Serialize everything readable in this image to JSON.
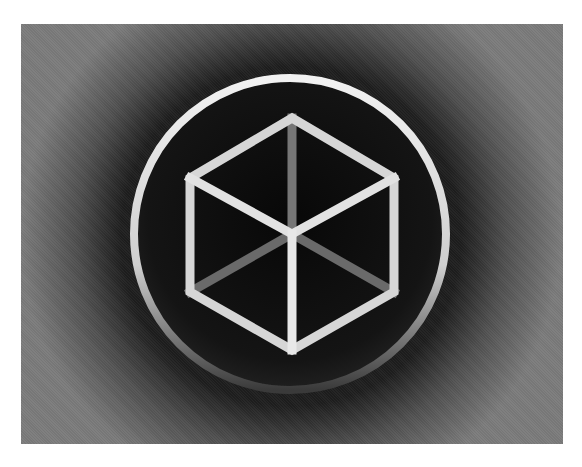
{
  "image": {
    "description": "Gray textured panel with a white ring enclosing a wireframe cube (hexagon with Y spokes) on a black disc",
    "colors": {
      "page_background": "#ffffff",
      "panel_gray": "#7b7b7b",
      "disc_black": "#0c0c0c",
      "ring": "#e6e6e6",
      "cube_bright_edges": "#d8d8d8",
      "cube_dim_edges": "#6e6e6e"
    },
    "panel": {
      "x": 21,
      "y": 24,
      "width": 542,
      "height": 420
    },
    "ring": {
      "cx": 290,
      "cy": 234,
      "r": 156,
      "stroke_width": 8
    },
    "cube": {
      "vertices": {
        "top": [
          292,
          118
        ],
        "upper_left": [
          190,
          178
        ],
        "upper_right": [
          394,
          178
        ],
        "lower_left": [
          190,
          292
        ],
        "lower_right": [
          394,
          292
        ],
        "bottom": [
          292,
          350
        ],
        "center": [
          292,
          234
        ]
      },
      "stroke_width": 9
    }
  }
}
